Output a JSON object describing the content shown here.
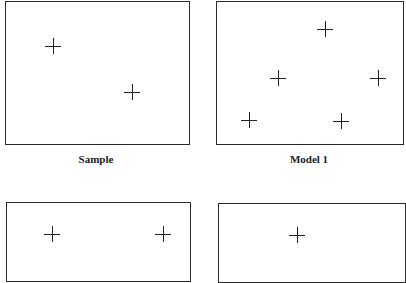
{
  "panels": [
    {
      "id": "sample-top",
      "label": "Sample",
      "box": {
        "left": 5,
        "top": 1,
        "width": 185,
        "height": 144
      },
      "crosses": [
        {
          "x": 53,
          "y": 46
        },
        {
          "x": 132,
          "y": 92
        }
      ]
    },
    {
      "id": "model-1",
      "label": "Model 1",
      "box": {
        "left": 216,
        "top": 1,
        "width": 188,
        "height": 144
      },
      "crosses": [
        {
          "x": 325,
          "y": 29
        },
        {
          "x": 278,
          "y": 78
        },
        {
          "x": 378,
          "y": 78
        },
        {
          "x": 249,
          "y": 120
        },
        {
          "x": 341,
          "y": 121
        }
      ]
    },
    {
      "id": "panel-bottom-left",
      "label": "",
      "box": {
        "left": 6,
        "top": 202,
        "width": 185,
        "height": 80
      },
      "crosses": [
        {
          "x": 52,
          "y": 234
        },
        {
          "x": 163,
          "y": 234
        }
      ]
    },
    {
      "id": "panel-bottom-right",
      "label": "",
      "box": {
        "left": 218,
        "top": 203,
        "width": 188,
        "height": 80
      },
      "crosses": [
        {
          "x": 297,
          "y": 235
        }
      ]
    }
  ],
  "labels": {
    "sample": "Sample",
    "model1": "Model 1"
  }
}
